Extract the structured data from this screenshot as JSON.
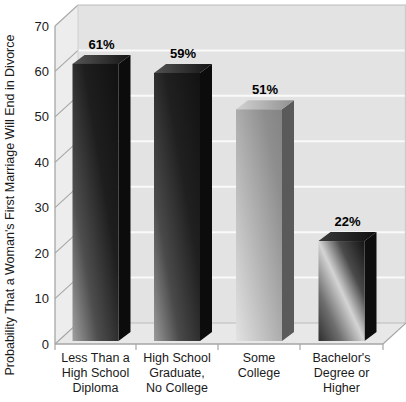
{
  "chart_data": {
    "type": "bar",
    "title": "",
    "xlabel": "",
    "ylabel": "Probability That a Woman's First Marriage Will End in Divorce",
    "ylim": [
      0,
      70
    ],
    "yticks": [
      0,
      10,
      20,
      30,
      40,
      50,
      60,
      70
    ],
    "grid": "horizontal-white-lines-on-gray-wall",
    "legend": "none",
    "projection": "pseudo-3d",
    "categories": [
      [
        "Less Than a",
        "High School",
        "Diploma"
      ],
      [
        "High School",
        "Graduate,",
        "No College"
      ],
      [
        "Some",
        "College"
      ],
      [
        "Bachelor's",
        "Degree or",
        "Higher"
      ]
    ],
    "values": [
      61,
      59,
      51,
      22
    ],
    "value_labels": [
      "61%",
      "59%",
      "51%",
      "22%"
    ],
    "bar_styles": [
      {
        "name": "dark-gunmetal",
        "front": [
          [
            0,
            "#a0a0a0"
          ],
          [
            0.28,
            "#4e4e4e"
          ],
          [
            0.62,
            "#1e1e1e"
          ],
          [
            1,
            "#111111"
          ]
        ],
        "side": "#0c0c0c",
        "top_left": "#565656",
        "top_right": "#141414"
      },
      {
        "name": "dark-gunmetal",
        "front": [
          [
            0,
            "#9a9a9a"
          ],
          [
            0.28,
            "#4a4a4a"
          ],
          [
            0.62,
            "#202020"
          ],
          [
            1,
            "#121212"
          ]
        ],
        "side": "#0c0c0c",
        "top_left": "#525252",
        "top_right": "#141414"
      },
      {
        "name": "silver",
        "front": [
          [
            0,
            "#e2e2e2"
          ],
          [
            0.45,
            "#b2b2b2"
          ],
          [
            0.8,
            "#8e8e8e"
          ],
          [
            1,
            "#848484"
          ]
        ],
        "side": "#5a5a5a",
        "top_left": "#d2d2d2",
        "top_right": "#909090"
      },
      {
        "name": "dark-metallic-sheen",
        "front": [
          [
            0,
            "#2e2e2e"
          ],
          [
            0.25,
            "#6e6e6e"
          ],
          [
            0.5,
            "#d4d4d4"
          ],
          [
            0.72,
            "#4a4a4a"
          ],
          [
            1,
            "#141414"
          ]
        ],
        "side": "#0e0e0e",
        "top_left": "#3a3a3a",
        "top_right": "#101010"
      }
    ]
  },
  "colors": {
    "background": "#ffffff",
    "wall": "#e3e3e3",
    "left_wall": "#ededed",
    "floor": "#e8e8e8",
    "gridline": "#fafafa",
    "axis_line": "#a6a6a6",
    "wall_edge": "#bcbcbc"
  }
}
